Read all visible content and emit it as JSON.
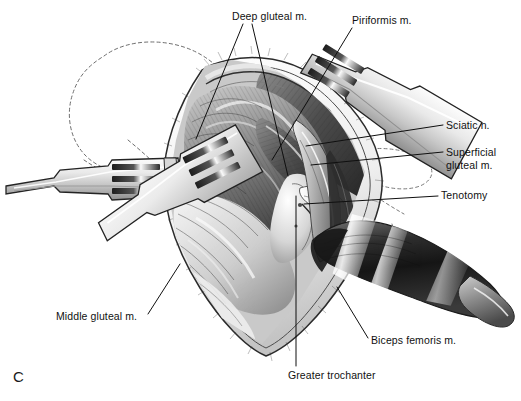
{
  "figure": {
    "panel_letter": "C",
    "background_color": "#ffffff",
    "ink_color": "#111111",
    "description_kind": "surgical-anatomy-illustration",
    "view": "posterior approach to the hip, deep dissection"
  },
  "annotations": [
    {
      "id": "deep-gluteal",
      "text": "Deep gluteal m.",
      "x": 232,
      "y": 10,
      "align": "left",
      "leaders": [
        {
          "x1": 243,
          "y1": 24,
          "x2": 196,
          "y2": 139
        },
        {
          "x1": 252,
          "y1": 24,
          "x2": 288,
          "y2": 176
        }
      ]
    },
    {
      "id": "piriformis",
      "text": "Piriformis m.",
      "x": 352,
      "y": 14,
      "align": "left",
      "leaders": [
        {
          "x1": 352,
          "y1": 28,
          "x2": 272,
          "y2": 160
        }
      ]
    },
    {
      "id": "sciatic-nerve",
      "text": "Sciatic n.",
      "x": 446,
      "y": 119,
      "align": "left",
      "leaders": [
        {
          "x1": 443,
          "y1": 125,
          "x2": 306,
          "y2": 146
        }
      ]
    },
    {
      "id": "superficial-gluteal",
      "text": "Superficial\ngluteal m.",
      "x": 446,
      "y": 146,
      "align": "left",
      "two_line": true,
      "leaders": [
        {
          "x1": 443,
          "y1": 152,
          "x2": 311,
          "y2": 165
        }
      ]
    },
    {
      "id": "tenotomy",
      "text": "Tenotomy",
      "x": 441,
      "y": 189,
      "align": "left",
      "leaders": [
        {
          "x1": 438,
          "y1": 196,
          "x2": 304,
          "y2": 204
        }
      ]
    },
    {
      "id": "biceps-femoris",
      "text": "Biceps femoris m.",
      "x": 371,
      "y": 334,
      "align": "left",
      "leaders": [
        {
          "x1": 368,
          "y1": 338,
          "x2": 337,
          "y2": 287
        }
      ]
    },
    {
      "id": "greater-trochanter",
      "text": "Greater trochanter",
      "x": 288,
      "y": 369,
      "align": "left",
      "leaders": [
        {
          "x1": 296,
          "y1": 366,
          "x2": 296,
          "y2": 196
        }
      ]
    },
    {
      "id": "middle-gluteal",
      "text": "Middle gluteal m.",
      "x": 56,
      "y": 310,
      "align": "left",
      "leaders": [
        {
          "x1": 148,
          "y1": 314,
          "x2": 180,
          "y2": 264
        }
      ]
    }
  ],
  "instruments": [
    {
      "name": "left-hohmann-retractor",
      "prongs": 3,
      "orientation": "horizontal-left"
    },
    {
      "name": "center-left-hohmann-retractor",
      "prongs": 3,
      "orientation": "oblique-lower-left"
    },
    {
      "name": "upper-right-hohmann-retractor",
      "prongs": 3,
      "orientation": "oblique-upper-right"
    }
  ],
  "anatomy": [
    {
      "name": "superficial-gluteal-muscle"
    },
    {
      "name": "middle-gluteal-muscle"
    },
    {
      "name": "deep-gluteal-muscle"
    },
    {
      "name": "piriformis-muscle"
    },
    {
      "name": "sciatic-nerve"
    },
    {
      "name": "greater-trochanter"
    },
    {
      "name": "biceps-femoris-muscle"
    },
    {
      "name": "tenotomy-site"
    },
    {
      "name": "pelvis-dashed-outline"
    },
    {
      "name": "skin-incision-margin"
    }
  ]
}
